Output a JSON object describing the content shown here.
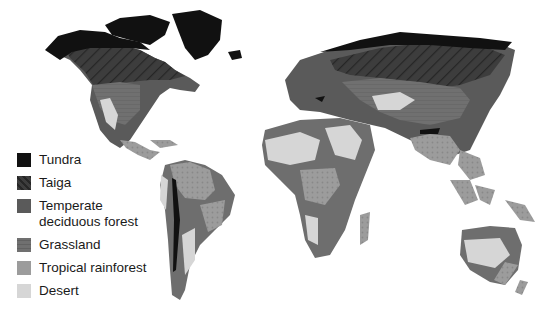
{
  "map": {
    "type": "world biome map",
    "colors": {
      "tundra": "#111111",
      "taiga": "#3a3a3a",
      "temperate_deciduous_forest": "#5a5a5a",
      "grassland": "#6e6e6e",
      "tropical_rainforest": "#9a9a9a",
      "desert": "#d6d6d6",
      "ocean": "#ffffff"
    }
  },
  "legend": {
    "items": [
      {
        "label": "Tundra",
        "color": "#111111",
        "pattern": "solid"
      },
      {
        "label": "Taiga",
        "color": "#3a3a3a",
        "pattern": "diagonal-hatch"
      },
      {
        "label": "Temperate deciduous forest",
        "line1": "Temperate",
        "line2": "deciduous forest",
        "color": "#5a5a5a",
        "pattern": "solid"
      },
      {
        "label": "Grassland",
        "color": "#6e6e6e",
        "pattern": "horizontal-lines"
      },
      {
        "label": "Tropical rainforest",
        "color": "#9a9a9a",
        "pattern": "dots"
      },
      {
        "label": "Desert",
        "color": "#d6d6d6",
        "pattern": "solid"
      }
    ]
  }
}
